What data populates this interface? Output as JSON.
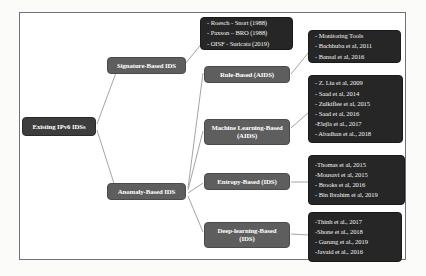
{
  "diagram": {
    "type": "taxonomy-tree",
    "colors": {
      "category_fill": "#5e5e5e",
      "citation_fill": "#262626",
      "root_fill": "#3d3d3d",
      "frame_border": "#6f7178",
      "edge": "#9a9a9a",
      "text": "#ffffff"
    },
    "root": {
      "label": "Existing IPv6 IDSs"
    },
    "branches": [
      {
        "id": "signature",
        "label": "Signature-Based  IDS"
      },
      {
        "id": "anomaly",
        "label": "Anomaly-Based IDS"
      }
    ],
    "subcategories": [
      {
        "id": "rule",
        "label": "Rule-Based (AIDS)"
      },
      {
        "id": "ml",
        "line1": "Machine Learning-Based",
        "line2": "(AIDS)"
      },
      {
        "id": "entropy",
        "label": "Entropy-Based (IDS)"
      },
      {
        "id": "deep",
        "line1": "Deep-learning-Based",
        "line2": "(IDS)"
      }
    ],
    "citation_groups": [
      {
        "id": "signature-cites",
        "items": [
          "- Roesch - Snort (1988)",
          "- Paxson – BRO (1988)",
          "- OISF - Suricata (2019)"
        ]
      },
      {
        "id": "rule-cites",
        "items": [
          "- Monitoring  Tools",
          "- Bachhuba  et al, 2011",
          "- Bansal et al, 2016"
        ]
      },
      {
        "id": "ml-cites",
        "items": [
          "- Z. Liu  et al, 2009",
          "- Saad et al, 2014",
          "- Zulkiflee  et al, 2015",
          "- Saad et al, 2016",
          "-Elejla  et al., 2017",
          "- Abadhan  et al., 2018"
        ]
      },
      {
        "id": "entropy-cites",
        "items": [
          "-Thomas et al, 2015",
          "-Mousavi et al, 2015",
          "- Brooks et al, 2016",
          "- Bin Ibrahim  et al, 2019"
        ]
      },
      {
        "id": "deep-cites",
        "items": [
          "-Thinh  et al., 2017",
          "-Shone et al., 2018",
          "- Gurung  et al., 2019",
          "-Javaid et al., 2016"
        ]
      }
    ]
  }
}
